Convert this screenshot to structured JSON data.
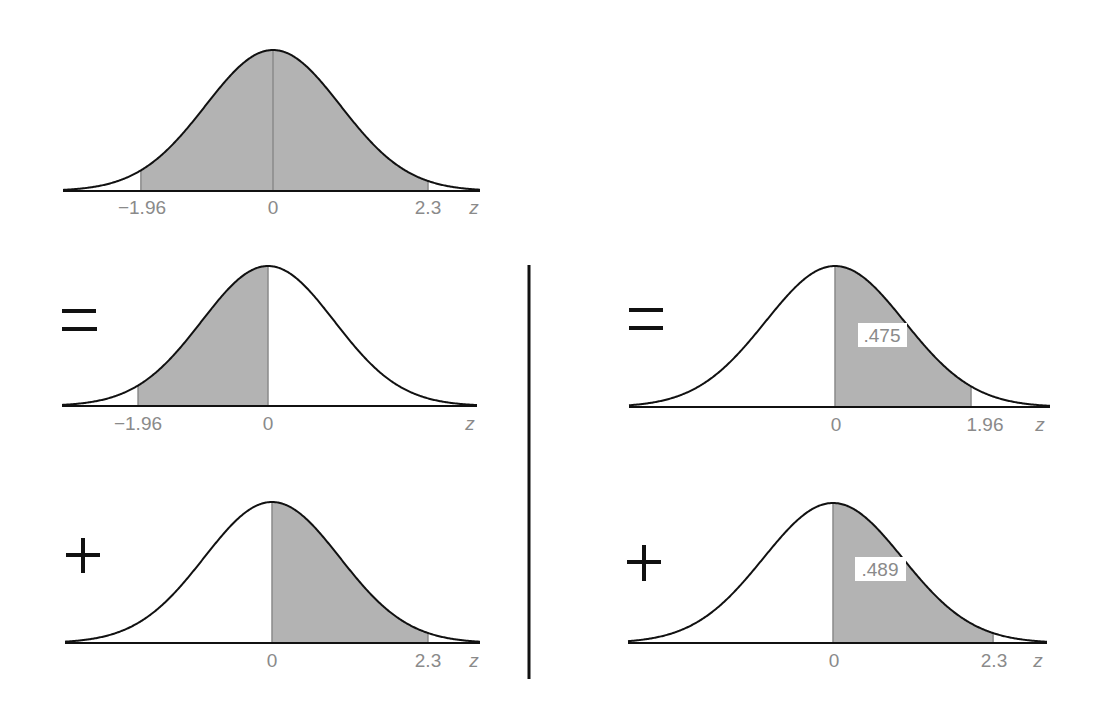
{
  "diagram": {
    "title": "",
    "operators": {
      "equals": "=",
      "plus": "+"
    },
    "axis_variable": "z",
    "colors": {
      "shade": "#b3b3b3",
      "curve": "#111111",
      "label": "#8a8a8a",
      "divider": "#111111"
    },
    "panels": [
      {
        "id": "top",
        "description": "Shaded area between z = -1.96 and z = 2.3",
        "shade_from": -1.96,
        "shade_to": 2.3,
        "ticks": [
          "−1.96",
          "0",
          "2.3"
        ],
        "area_label": null
      },
      {
        "id": "middle-left",
        "operator": "=",
        "description": "Shaded area between z = -1.96 and z = 0",
        "shade_from": -1.96,
        "shade_to": 0,
        "ticks": [
          "−1.96",
          "0"
        ],
        "area_label": null
      },
      {
        "id": "bottom-left",
        "operator": "+",
        "description": "Shaded area between z = 0 and z = 2.3",
        "shade_from": 0,
        "shade_to": 2.3,
        "ticks": [
          "0",
          "2.3"
        ],
        "area_label": null
      },
      {
        "id": "middle-right",
        "operator": "=",
        "description": "Shaded area between z = 0 and z = 1.96 (by symmetry)",
        "shade_from": 0,
        "shade_to": 1.96,
        "ticks": [
          "0",
          "1.96"
        ],
        "area_label": ".475"
      },
      {
        "id": "bottom-right",
        "operator": "+",
        "description": "Shaded area between z = 0 and z = 2.3",
        "shade_from": 0,
        "shade_to": 2.3,
        "ticks": [
          "0",
          "2.3"
        ],
        "area_label": ".489"
      }
    ]
  },
  "labels": {
    "top": {
      "t0": "−1.96",
      "t1": "0",
      "t2": "2.3",
      "z": "z"
    },
    "ml": {
      "op": "=",
      "t0": "−1.96",
      "t1": "0",
      "z": "z"
    },
    "bl": {
      "op": "+",
      "t0": "0",
      "t1": "2.3",
      "z": "z"
    },
    "mr": {
      "op": "=",
      "t0": "0",
      "t1": "1.96",
      "z": "z",
      "area": ".475"
    },
    "br": {
      "op": "+",
      "t0": "0",
      "t1": "2.3",
      "z": "z",
      "area": ".489"
    }
  }
}
